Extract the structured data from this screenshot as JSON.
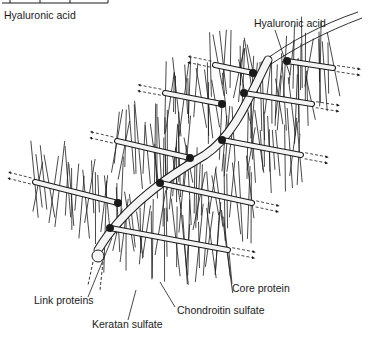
{
  "figure": {
    "labels": {
      "hyaluronic_acid_corner": "Hyaluronic acid",
      "hyaluronic_acid": "Hyaluronic acid",
      "core_protein": "Core protein",
      "link_proteins": "Link proteins",
      "chondroitin_sulfate": "Chondroitin sulfate",
      "keratan_sulfate": "Keratan sulfate"
    },
    "colors": {
      "line": "#1a1a1a",
      "background": "#ffffff",
      "rod_fill": "#f4f4f4"
    },
    "core_proteins": [
      {
        "x1": 215,
        "y1": 65,
        "x2": 253,
        "y2": 73,
        "arrow": "left"
      },
      {
        "x1": 287,
        "y1": 61,
        "x2": 333,
        "y2": 68,
        "arrow": "right"
      },
      {
        "x1": 165,
        "y1": 93,
        "x2": 222,
        "y2": 104,
        "arrow": "left"
      },
      {
        "x1": 244,
        "y1": 93,
        "x2": 312,
        "y2": 104,
        "arrow": "right"
      },
      {
        "x1": 117,
        "y1": 141,
        "x2": 190,
        "y2": 158,
        "arrow": "left"
      },
      {
        "x1": 222,
        "y1": 140,
        "x2": 301,
        "y2": 155,
        "arrow": "right"
      },
      {
        "x1": 35,
        "y1": 182,
        "x2": 118,
        "y2": 203,
        "arrow": "left"
      },
      {
        "x1": 160,
        "y1": 183,
        "x2": 252,
        "y2": 203,
        "arrow": "right"
      },
      {
        "x1": 110,
        "y1": 228,
        "x2": 228,
        "y2": 250,
        "arrow": "right"
      }
    ]
  }
}
